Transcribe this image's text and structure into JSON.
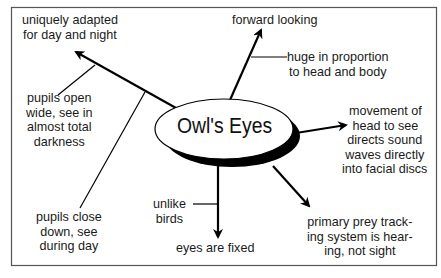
{
  "diagram": {
    "title": "Owl's Eyes",
    "type": "concept map",
    "nodes": {
      "adapted": "uniquely adapted\nfor day and night",
      "pupils_open": "pupils open\nwide, see in\nalmost total\ndarkness",
      "pupils_close": "pupils close\ndown, see\nduring day",
      "forward": "forward looking",
      "huge": "huge in proportion\nto head and body",
      "movement": "movement of\nhead to see",
      "sound": "directs sound\nwaves directly\ninto facial discs",
      "unlike": "unlike\nbirds",
      "fixed": "eyes are fixed",
      "prey": "primary prey track-\ning system is hear-\ning, not sight"
    },
    "colors": {
      "line": "#000000",
      "border": "#555555",
      "text": "#1a1a1a",
      "background": "#ffffff"
    }
  }
}
